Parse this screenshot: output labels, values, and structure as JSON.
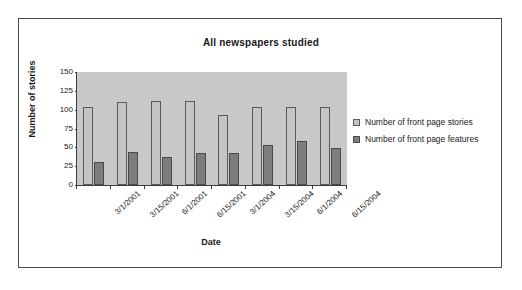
{
  "chart_data": {
    "type": "bar",
    "title": "All newspapers studied",
    "xlabel": "Date",
    "ylabel": "Number of stories",
    "categories": [
      "3/1/2001",
      "3/15/2001",
      "6/1/2001",
      "6/15/2001",
      "3/1/2004",
      "3/15/2004",
      "6/1/2004",
      "6/15/2004"
    ],
    "series": [
      {
        "name": "Number of front page stories",
        "color": "#c4c4c4",
        "values": [
          104,
          110,
          111,
          111,
          93,
          103,
          103,
          104
        ]
      },
      {
        "name": "Number of front page features",
        "color": "#7d7d7d",
        "values": [
          30,
          44,
          37,
          42,
          42,
          53,
          59,
          49
        ]
      }
    ],
    "ylim": [
      0,
      150
    ],
    "yticks": [
      0,
      25,
      50,
      75,
      100,
      125,
      150
    ],
    "ytick_labels": [
      "0",
      "25",
      "50",
      "75",
      "100",
      "125",
      "150"
    ],
    "grid": false,
    "legend_position": "right",
    "plot_background": "#c8c8c8",
    "frame_color": "#4a4a4a"
  }
}
